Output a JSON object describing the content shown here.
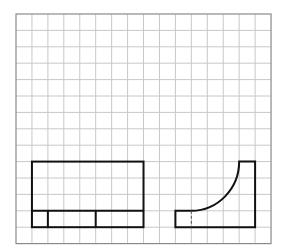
{
  "diagram": {
    "type": "orthographic-projection-grid",
    "grid": {
      "origin_x": 16,
      "origin_y": 14,
      "cols": 16,
      "rows": 14,
      "cell_w": 15.94,
      "cell_h": 16.4,
      "line_color": "#c8c8c8",
      "border_color": "#8a8a8a"
    },
    "stroke_color": "#111111",
    "stroke_width": 2,
    "views": [
      {
        "name": "front-view",
        "outline": {
          "col0": 1,
          "row0": 9,
          "col1": 8,
          "row1": 13
        },
        "horizontal_lines": [
          {
            "row": 12,
            "col0": 1,
            "col1": 8
          }
        ],
        "vertical_lines": [
          {
            "col": 2,
            "row0": 12,
            "row1": 13
          },
          {
            "col": 5,
            "row0": 12,
            "row1": 13
          }
        ]
      },
      {
        "name": "side-view",
        "points": {
          "left": 10,
          "inner": 11,
          "arc_end": 14,
          "right": 15,
          "top": 9,
          "step": 12,
          "bottom": 13
        },
        "hidden_line": {
          "col": 11,
          "row0": 12,
          "row1": 13
        }
      }
    ]
  }
}
